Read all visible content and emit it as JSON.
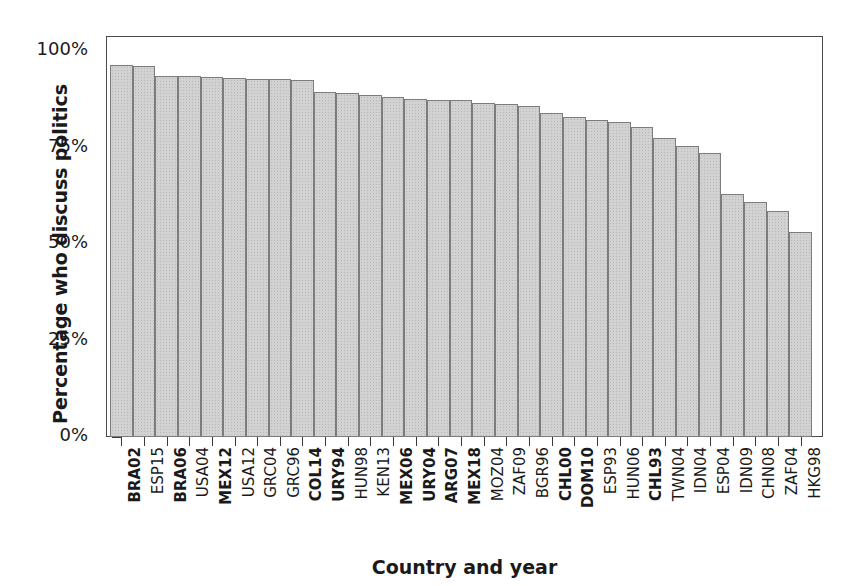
{
  "chart_data": {
    "type": "bar",
    "title": "",
    "xlabel": "Country and year",
    "ylabel": "Percentage who discuss politics",
    "ylim": [
      0,
      100
    ],
    "yticks": [
      0,
      25,
      50,
      75,
      100
    ],
    "ytick_labels": [
      "0%",
      "25%",
      "50%",
      "75%",
      "100%"
    ],
    "grid": false,
    "legend": "none",
    "bar_color": "#d2d2d2",
    "bar_edge_color": "#7c7c7c",
    "categories": [
      "BRA02",
      "ESP15",
      "BRA06",
      "USA04",
      "MEX12",
      "USA12",
      "GRC04",
      "GRC96",
      "COL14",
      "URY94",
      "HUN98",
      "KEN13",
      "MEX06",
      "URY04",
      "ARG07",
      "MEX18",
      "MOZ04",
      "ZAF09",
      "BGR96",
      "CHL00",
      "DOM10",
      "ESP93",
      "HUN06",
      "CHL93",
      "TWN04",
      "IDN04",
      "ESP04",
      "IDN09",
      "CHN08",
      "ZAF04",
      "HKG98"
    ],
    "values": [
      96.5,
      96.0,
      93.5,
      93.5,
      93.3,
      93.0,
      92.8,
      92.8,
      92.6,
      89.5,
      89.0,
      88.5,
      88.2,
      87.5,
      87.3,
      87.3,
      86.5,
      86.2,
      85.8,
      84.0,
      83.0,
      82.0,
      81.5,
      80.3,
      77.5,
      75.5,
      73.5,
      63.0,
      61.0,
      58.5,
      53.0
    ],
    "bold_categories": [
      "BRA02",
      "BRA06",
      "MEX12",
      "COL14",
      "URY94",
      "MEX06",
      "URY04",
      "ARG07",
      "MEX18",
      "CHL00",
      "DOM10",
      "CHL93"
    ]
  }
}
